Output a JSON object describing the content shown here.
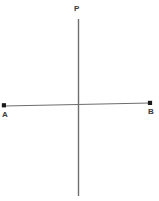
{
  "figure": {
    "type": "geometry-diagram",
    "background_color": "#ffffff",
    "line_color": "#6e6e6e",
    "point_color": "#1a1a1a",
    "label_color": "#3a3a3a",
    "width": 159,
    "height": 201,
    "labels": {
      "vertical_line": "P",
      "left_point": "A",
      "right_point": "B"
    },
    "geometry": {
      "vertical_line": {
        "name": "line-P",
        "x1": 78.5,
        "y1": 19,
        "x2": 78.5,
        "y2": 196
      },
      "horizontal_line": {
        "name": "segment-AB",
        "x1": 4,
        "y1": 106,
        "x2": 150,
        "y2": 103
      },
      "points": [
        {
          "name": "A",
          "x": 4,
          "y": 105.5
        },
        {
          "name": "B",
          "x": 150,
          "y": 103
        }
      ],
      "intersection": {
        "x": 78.5,
        "y": 104.5
      }
    }
  }
}
